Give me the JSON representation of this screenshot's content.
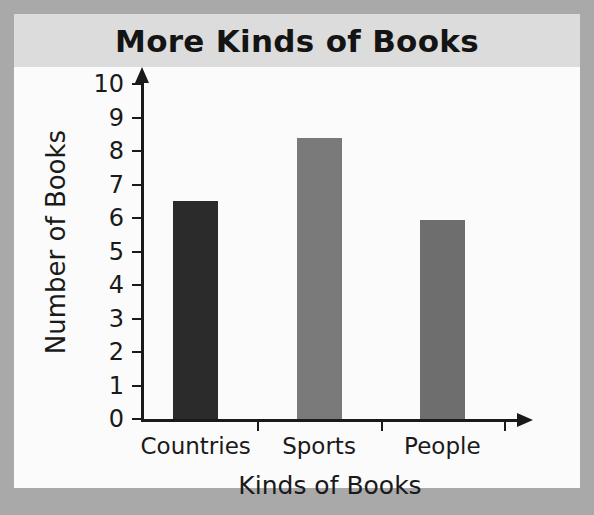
{
  "chart_data": {
    "type": "bar",
    "title": "More Kinds of Books",
    "xlabel": "Kinds of Books",
    "ylabel": "Number of Books",
    "categories": [
      "Countries",
      "Sports",
      "People"
    ],
    "values": [
      6.5,
      8.4,
      5.95
    ],
    "series": [
      {
        "name": "Number of Books",
        "values": [
          6.5,
          8.4,
          5.95
        ]
      }
    ],
    "ylim": [
      0,
      10
    ],
    "ytick_labels": [
      "0",
      "1",
      "2",
      "3",
      "4",
      "5",
      "6",
      "7",
      "8",
      "9",
      "10"
    ],
    "ytick_values": [
      0,
      1,
      2,
      3,
      4,
      5,
      6,
      7,
      8,
      9,
      10
    ],
    "grid": false,
    "legend": "none",
    "bar_colors": [
      "#2b2b2b",
      "#7a7a7a",
      "#6e6e6e"
    ],
    "axis_color": "#1a1a1a",
    "title_band_color": "#dcdcdc",
    "page_background": "#a9a9a9",
    "card_background": "#fbfbfb"
  }
}
